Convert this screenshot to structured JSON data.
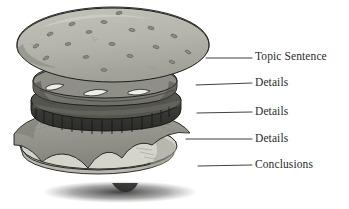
{
  "diagram": {
    "style": "grayscale line drawing",
    "background_color": "#ffffff",
    "outline_color": "#1a1a1a"
  },
  "labels": [
    {
      "id": "topic-sentence",
      "text": "Topic Sentence",
      "points_to": "top-bun"
    },
    {
      "id": "details-1",
      "text": "Details",
      "points_to": "cheese-pickle-layer"
    },
    {
      "id": "details-2",
      "text": "Details",
      "points_to": "patty"
    },
    {
      "id": "details-3",
      "text": "Details",
      "points_to": "lettuce"
    },
    {
      "id": "conclusions",
      "text": "Conclusions",
      "points_to": "bottom-bun"
    }
  ],
  "layers": [
    {
      "id": "top-bun",
      "name": "top bun with sesame seeds",
      "label": "Topic Sentence",
      "fill": "#b6b6ac",
      "shade": "#9d9d93",
      "seed_fill": "#8d8d84",
      "seed_count": 18
    },
    {
      "id": "cheese-pickle-layer",
      "name": "cheese and pickle layer",
      "label": "Details",
      "fill": "#8a8a82",
      "shade": "#5e5e58",
      "highlight": "#e8e8e2"
    },
    {
      "id": "patty",
      "name": "meat patty",
      "label": "Details",
      "fill": "#4a4a46",
      "shade": "#2e2e2b",
      "rim": "#6a6a63"
    },
    {
      "id": "lettuce",
      "name": "lettuce leaf",
      "label": "Details",
      "fill": "#9a9a92",
      "shade": "#7b7b74"
    },
    {
      "id": "bottom-bun",
      "name": "bottom bun",
      "label": "Conclusions",
      "fill": "#cfcfc6",
      "shade": "#aeaea5"
    },
    {
      "id": "shadow",
      "name": "cast shadow",
      "label": "",
      "fill": "#3a3a38"
    }
  ],
  "leader_lines": [
    {
      "id": "leader-topic-sentence",
      "from_x": 206,
      "from_y": 58,
      "to_x": 252,
      "to_y": 58
    },
    {
      "id": "leader-details-1",
      "from_x": 196,
      "from_y": 85,
      "to_x": 252,
      "to_y": 83
    },
    {
      "id": "leader-details-2",
      "from_x": 197,
      "from_y": 113,
      "to_x": 252,
      "to_y": 112
    },
    {
      "id": "leader-details-3",
      "from_x": 186,
      "from_y": 139,
      "to_x": 252,
      "to_y": 139
    },
    {
      "id": "leader-conclusions",
      "from_x": 198,
      "from_y": 166,
      "to_x": 252,
      "to_y": 165
    }
  ]
}
